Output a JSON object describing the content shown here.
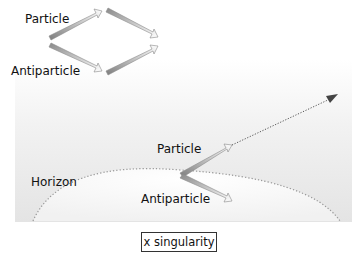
{
  "top_pair": {
    "particle_label": "Particle",
    "antiparticle_label": "Antiparticle"
  },
  "bottom_pair": {
    "particle_label": "Particle",
    "antiparticle_label": "Antiparticle"
  },
  "horizon_label": "Horizon",
  "singularity_label": "x singularity",
  "colors": {
    "arrow_dark": "#8a8a8a",
    "arrow_light": "#ffffff",
    "horizon_dots": "#999999",
    "escape_arrow": "#555555"
  }
}
